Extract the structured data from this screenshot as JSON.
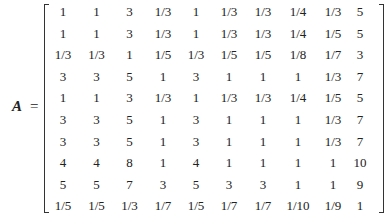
{
  "equation": {
    "variable": "A",
    "equals": "="
  },
  "matrix": {
    "rows": [
      [
        "1",
        "1",
        "3",
        "1/3",
        "1",
        "1/3",
        "1/3",
        "1/4",
        "1/3",
        "5"
      ],
      [
        "1",
        "1",
        "3",
        "1/3",
        "1",
        "1/3",
        "1/3",
        "1/4",
        "1/5",
        "5"
      ],
      [
        "1/3",
        "1/3",
        "1",
        "1/5",
        "1/3",
        "1/5",
        "1/5",
        "1/8",
        "1/7",
        "3"
      ],
      [
        "3",
        "3",
        "5",
        "1",
        "3",
        "1",
        "1",
        "1",
        "1/3",
        "7"
      ],
      [
        "1",
        "1",
        "3",
        "1/3",
        "1",
        "1/3",
        "1/3",
        "1/4",
        "1/5",
        "5"
      ],
      [
        "3",
        "3",
        "5",
        "1",
        "3",
        "1",
        "1",
        "1",
        "1/3",
        "7"
      ],
      [
        "3",
        "3",
        "5",
        "1",
        "3",
        "1",
        "1",
        "1",
        "1/3",
        "7"
      ],
      [
        "4",
        "4",
        "8",
        "1",
        "4",
        "1",
        "1",
        "1",
        "1",
        "10"
      ],
      [
        "5",
        "5",
        "7",
        "3",
        "5",
        "3",
        "3",
        "1",
        "1",
        "9"
      ],
      [
        "1/5",
        "1/5",
        "1/3",
        "1/7",
        "1/5",
        "1/7",
        "1/7",
        "1/10",
        "1/9",
        "1"
      ]
    ]
  }
}
